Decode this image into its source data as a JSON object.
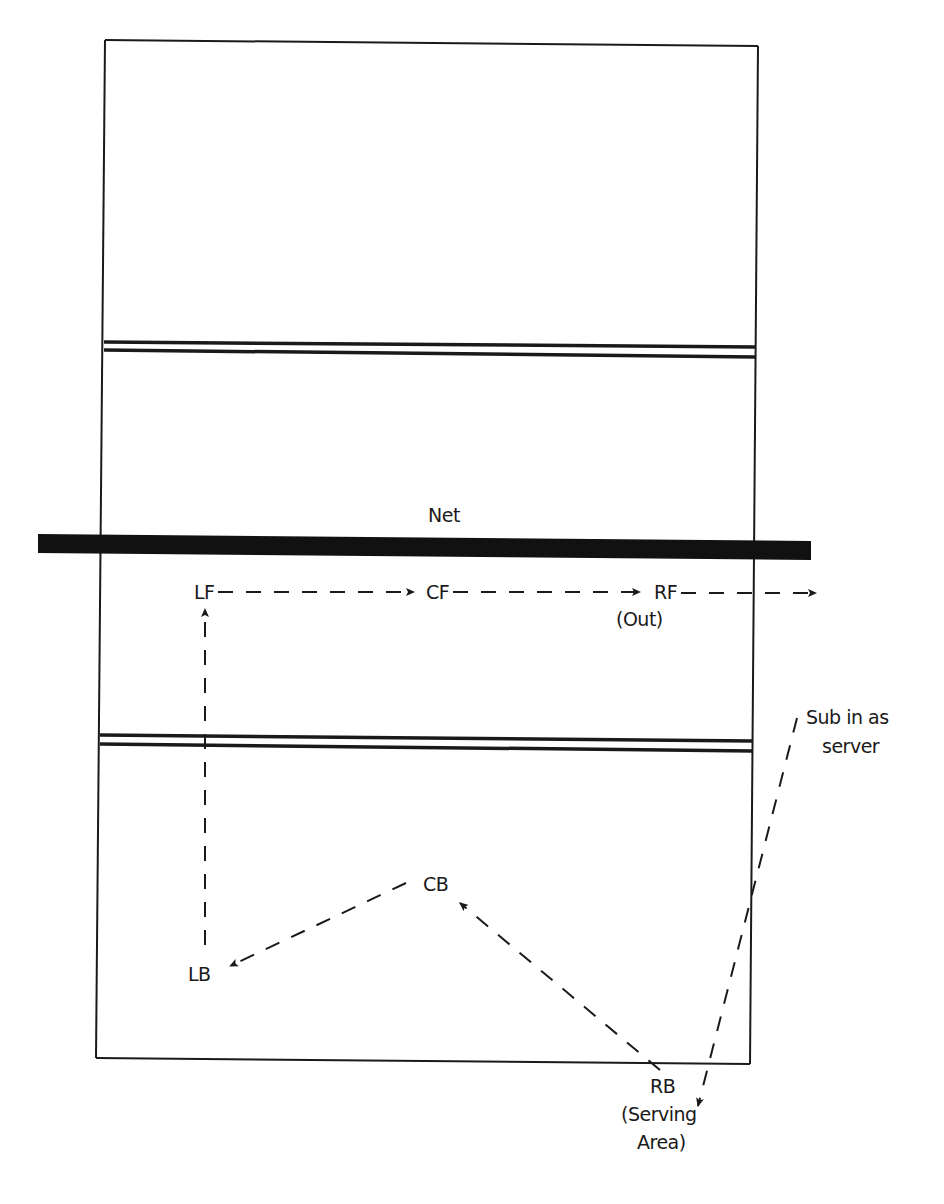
{
  "diagram": {
    "type": "volleyball-court-rotation",
    "net_label": "Net",
    "positions": {
      "LF": {
        "label": "LF"
      },
      "CF": {
        "label": "CF"
      },
      "RF": {
        "label": "RF",
        "note": "(Out)"
      },
      "LB": {
        "label": "LB"
      },
      "CB": {
        "label": "CB"
      },
      "RB": {
        "label": "RB",
        "note_line1": "(Serving",
        "note_line2": "Area)"
      }
    },
    "annotations": {
      "sub_line1": "Sub in as",
      "sub_line2": "server"
    },
    "flows": [
      {
        "from": "RB",
        "to": "CB"
      },
      {
        "from": "CB",
        "to": "LB"
      },
      {
        "from": "LB",
        "to": "LF"
      },
      {
        "from": "LF",
        "to": "CF"
      },
      {
        "from": "CF",
        "to": "RF"
      },
      {
        "from": "RF",
        "to": "out"
      },
      {
        "from": "sub",
        "to": "RB"
      }
    ],
    "colors": {
      "line": "#1a1a1a",
      "background": "#ffffff"
    }
  }
}
